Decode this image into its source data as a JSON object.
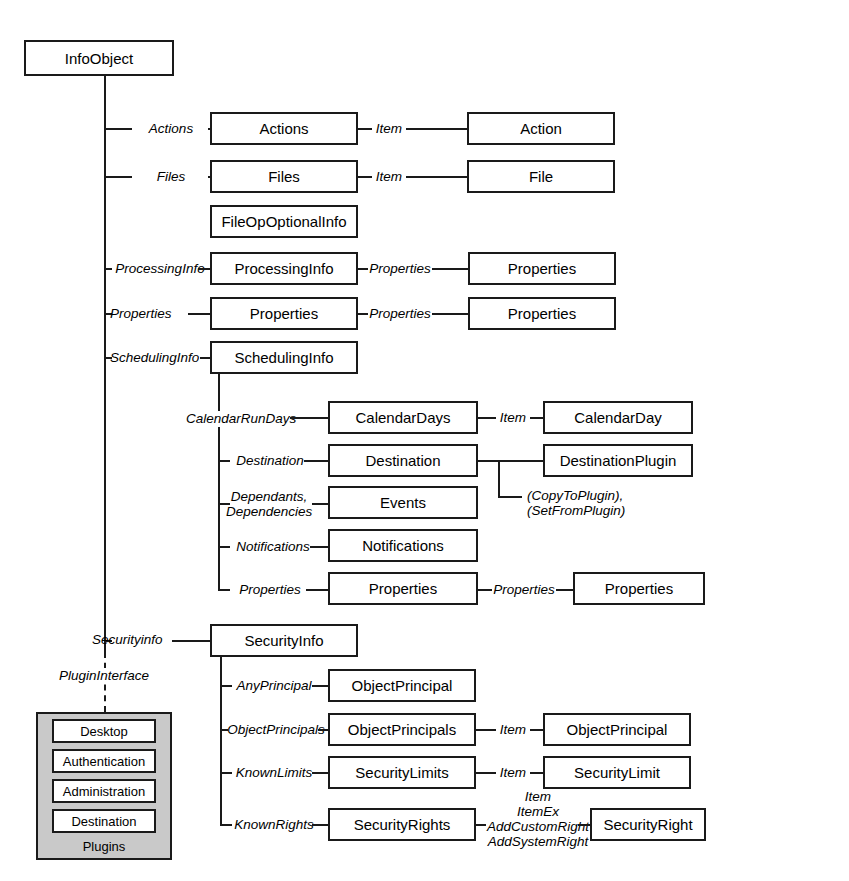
{
  "diagram": {
    "title": "InfoObject",
    "root": {
      "label": "InfoObject"
    },
    "nodes": {
      "actions_coll": "Actions",
      "action": "Action",
      "files_coll": "Files",
      "file": "File",
      "fileop": "FileOpOptionalInfo",
      "processinginfo": "ProcessingInfo",
      "processinginfo_props": "Properties",
      "properties_coll": "Properties",
      "properties_props": "Properties",
      "schedulinginfo": "SchedulingInfo",
      "calendardays": "CalendarDays",
      "calendarday": "CalendarDay",
      "destination": "Destination",
      "destinationplugin": "DestinationPlugin",
      "events": "Events",
      "notifications": "Notifications",
      "sched_properties": "Properties",
      "sched_properties2": "Properties",
      "securityinfo": "SecurityInfo",
      "objectprincipal_any": "ObjectPrincipal",
      "objectprincipals": "ObjectPrincipals",
      "objectprincipal_item": "ObjectPrincipal",
      "securitylimits": "SecurityLimits",
      "securitylimit": "SecurityLimit",
      "securityrights": "SecurityRights",
      "securityright": "SecurityRight"
    },
    "edge_labels": {
      "actions": "Actions",
      "actions_item": "Item",
      "files": "Files",
      "files_item": "Item",
      "processinginfo": "ProcessingInfo",
      "processinginfo_properties": "Properties",
      "properties": "Properties",
      "properties_properties": "Properties",
      "schedulinginfo": "SchedulingInfo",
      "calendarrundays": "CalendarRunDays",
      "calendardays_item": "Item",
      "destination": "Destination",
      "destination_plugin_note": "(CopyToPlugin),\n(SetFromPlugin)",
      "dependants": "Dependants,\nDependencies",
      "notifications": "Notifications",
      "sched_properties": "Properties",
      "sched_properties_properties": "Properties",
      "securityinfo": "Securityinfo",
      "plugininterface": "PluginInterface",
      "anyprincipal": "AnyPrincipal",
      "objectprincipals": "ObjectPrincipals",
      "objectprincipals_item": "Item",
      "knownlimits": "KnownLimits",
      "securitylimits_item": "Item",
      "knownrights": "KnownRights",
      "securityrights_methods": "Item\nItemEx\nAddCustomRight\nAddSystemRight"
    },
    "plugins": {
      "caption": "Plugins",
      "items": [
        {
          "label": "Desktop"
        },
        {
          "label": "Authentication"
        },
        {
          "label": "Administration"
        },
        {
          "label": "Destination"
        }
      ]
    },
    "colors": {
      "line": "#1a1a1a",
      "box_fill": "#ffffff",
      "plugins_fill": "#c9c9c9",
      "text": "#000000"
    }
  }
}
